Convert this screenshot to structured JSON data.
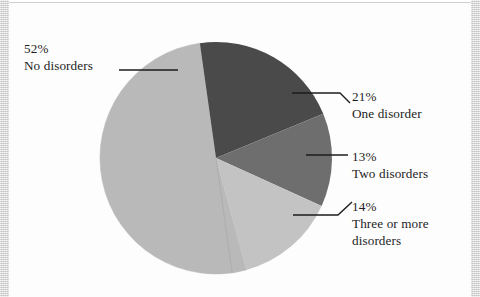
{
  "figure": {
    "kind": "pie-chart",
    "background": "#ffffff"
  },
  "chart_data": {
    "type": "pie",
    "title": "",
    "xlabel": "",
    "ylabel": "",
    "units": "percent",
    "total": 100,
    "legend_position": "callout-labels",
    "grid": false,
    "categories": [
      "No disorders",
      "One disorder",
      "Two disorders",
      "Three or more disorders"
    ],
    "values": [
      52,
      21,
      13,
      14
    ],
    "value_labels": [
      "52%",
      "21%",
      "13%",
      "14%"
    ],
    "colors": [
      "#b9b9b9",
      "#4a4a4a",
      "#6e6e6e",
      "#c3c3c3"
    ],
    "slices": [
      {
        "label": "No disorders",
        "percent": 52,
        "percent_label": "52%",
        "color": "#b9b9b9",
        "start_angle": 172,
        "end_angle": 352
      },
      {
        "label": "One disorder",
        "percent": 21,
        "percent_label": "21%",
        "color": "#4a4a4a",
        "start_angle": 352,
        "end_angle": 75.6
      },
      {
        "label": "Two disorders",
        "percent": 13,
        "percent_label": "13%",
        "color": "#6e6e6e",
        "start_angle": 75.6,
        "end_angle": 122.4
      },
      {
        "label": "Three or more disorders",
        "percent": 14,
        "percent_label": "14%",
        "color": "#c3c3c3",
        "start_angle": 122.4,
        "end_angle": 172
      }
    ]
  },
  "labels": {
    "no_disorders": {
      "percent": "52%",
      "name": "No disorders"
    },
    "one_disorder": {
      "percent": "21%",
      "name": "One disorder"
    },
    "two_disorders": {
      "percent": "13%",
      "name": "Two disorders"
    },
    "three_or_more": {
      "percent": "14%",
      "name": "Three or more disorders"
    }
  }
}
